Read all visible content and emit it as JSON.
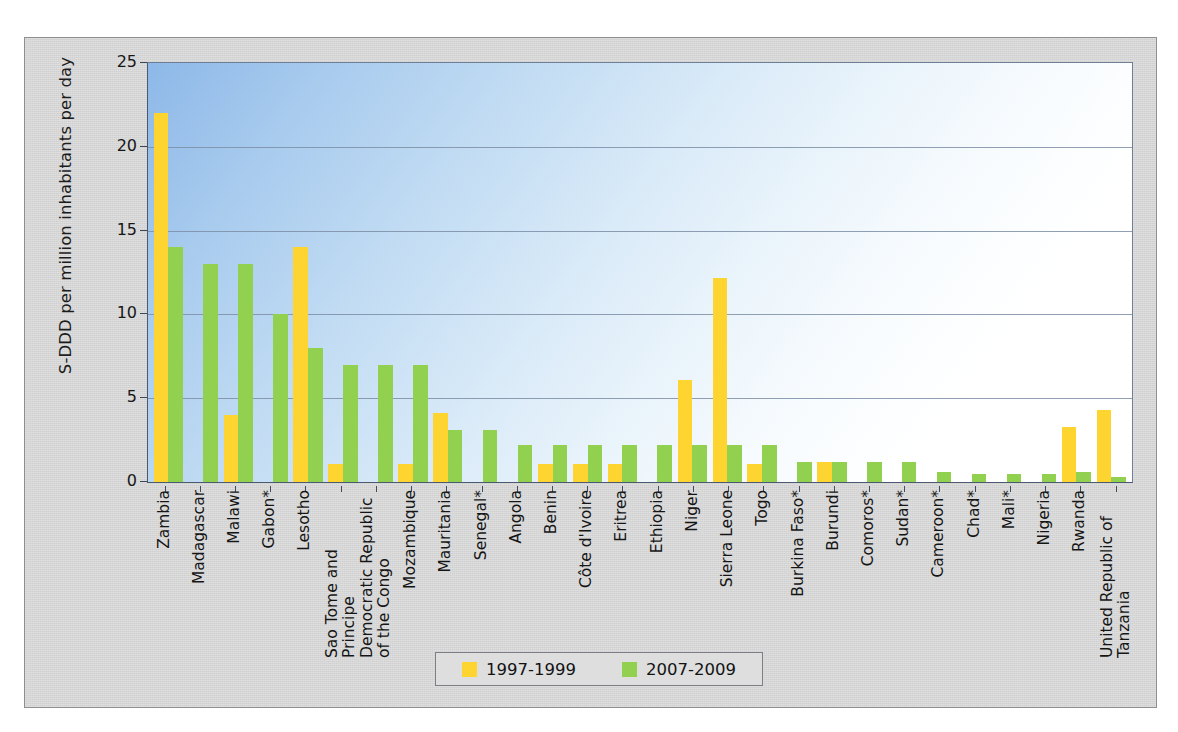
{
  "chart_data": {
    "type": "bar",
    "title": "",
    "subtitle": "",
    "xlabel": "",
    "ylabel": "S-DDD per million inhabitants per day",
    "ylim": [
      0,
      25
    ],
    "yticks": [
      0,
      5,
      10,
      15,
      20,
      25
    ],
    "grid": true,
    "legend_position": "bottom",
    "categories": [
      "Zambia",
      "Madagascar",
      "Malawi",
      "Gabon*",
      "Lesotho",
      "Sao Tome and Principe",
      "Democratic Republic of the Congo",
      "Mozambique",
      "Mauritania",
      "Senegal*",
      "Angola",
      "Benin",
      "Côte d'Ivoire",
      "Eritrea",
      "Ethiopia",
      "Niger",
      "Sierra Leone",
      "Togo",
      "Burkina Faso*",
      "Burundi",
      "Comoros*",
      "Sudan*",
      "Cameroon*",
      "Chad*",
      "Mali*",
      "Nigeria",
      "Rwanda",
      "United Republic of Tanzania"
    ],
    "series": [
      {
        "name": "1997-1999",
        "color": "#fdd430",
        "values": [
          22.0,
          0,
          4.0,
          0,
          14.0,
          1.1,
          0,
          1.1,
          4.1,
          0,
          0,
          1.1,
          1.1,
          1.1,
          0,
          6.1,
          12.2,
          1.1,
          0,
          1.2,
          0,
          0,
          0,
          0,
          0,
          0,
          3.3,
          4.3
        ]
      },
      {
        "name": "2007-2009",
        "color": "#92d14f",
        "values": [
          14.0,
          13.0,
          13.0,
          10.0,
          8.0,
          7.0,
          7.0,
          7.0,
          3.1,
          3.1,
          2.2,
          2.2,
          2.2,
          2.2,
          2.2,
          2.2,
          2.2,
          2.2,
          1.2,
          1.2,
          1.2,
          1.2,
          0.6,
          0.5,
          0.5,
          0.5,
          0.6,
          0.3
        ]
      }
    ]
  },
  "legend": {
    "items": [
      {
        "label": "1997-1999",
        "color": "#fdd430"
      },
      {
        "label": "2007-2009",
        "color": "#92d14f"
      }
    ]
  },
  "axis": {
    "y_title": "S-DDD per million inhabitants per day",
    "y_ticks": [
      "25",
      "20",
      "15",
      "10",
      "5",
      "0"
    ]
  }
}
